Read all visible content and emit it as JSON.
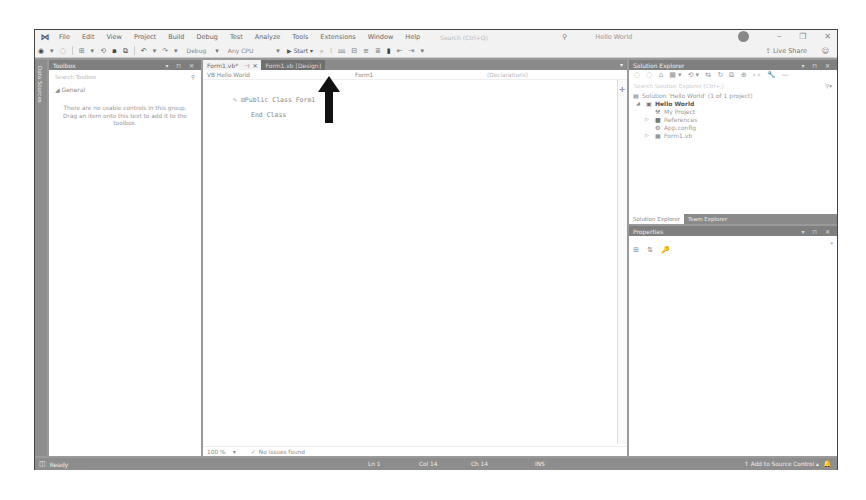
{
  "menubar": {
    "logo": "VS",
    "items": [
      "File",
      "Edit",
      "View",
      "Project",
      "Build",
      "Debug",
      "Test",
      "Analyze",
      "Tools",
      "Extensions",
      "Window",
      "Help"
    ],
    "quick_search_placeholder": "Search (Ctrl+Q)",
    "title": "Hello World",
    "window_controls": {
      "minimize": "–",
      "restore": "❐",
      "close": "✕"
    }
  },
  "toolbar": {
    "config": "Debug",
    "platform": "Any CPU",
    "start_label": "Start",
    "live_share": "Live Share",
    "icons": [
      "back-icon",
      "forward-icon",
      "new-project-icon",
      "save-icon",
      "save-all-icon",
      "undo-icon",
      "redo-icon"
    ]
  },
  "side_strip": {
    "label": "Data Sources"
  },
  "toolbox": {
    "title": "Toolbox",
    "controls": "▾ ⊓ ✕",
    "search_placeholder": "Search Toolbox",
    "group": "◢ General",
    "empty_message": "There are no usable controls in this group. Drag an item onto this text to add it to the toolbox."
  },
  "editor": {
    "tabs": [
      {
        "label": "Form1.vb*",
        "pin": "⊣",
        "close": "✕",
        "active": true
      },
      {
        "label": "Form1.vb [Design]",
        "active": false
      }
    ],
    "nav": {
      "project": "VB Hello World",
      "class": "Form1",
      "member": "(Declarations)"
    },
    "code_lines": [
      "⊟Public Class Form1",
      "End Class"
    ],
    "zoom_level": "100 %",
    "issues": "No issues found"
  },
  "solution_explorer": {
    "title": "Solution Explorer",
    "search_placeholder": "Search Solution Explorer (Ctrl+;)",
    "tree": [
      {
        "indent": 0,
        "expander": "",
        "icon": "▤",
        "label": "Solution 'Hello World' (1 of 1 project)",
        "bold": false
      },
      {
        "indent": 1,
        "expander": "◢",
        "icon": "▣",
        "label": "Hello World",
        "bold": true
      },
      {
        "indent": 2,
        "expander": "",
        "icon": "🔧",
        "label": "My Project",
        "bold": false
      },
      {
        "indent": 2,
        "expander": "▷",
        "icon": "■",
        "label": "References",
        "bold": false
      },
      {
        "indent": 2,
        "expander": "",
        "icon": "⚙",
        "label": "App.config",
        "bold": false
      },
      {
        "indent": 2,
        "expander": "▷",
        "icon": "▦",
        "label": "Form1.vb",
        "bold": false
      }
    ],
    "bottom_tabs": [
      "Solution Explorer",
      "Team Explorer"
    ]
  },
  "properties": {
    "title": "Properties",
    "tools": "⊞ ⇅ 🔑"
  },
  "statusbar": {
    "ready": "Ready",
    "line": "Ln 1",
    "col": "Col 14",
    "ch": "Ch 14",
    "mode": "INS",
    "source_control": "↑ Add to Source Control ▴"
  },
  "annotation": {
    "arrow_color": "#111111",
    "target": "Start button"
  }
}
